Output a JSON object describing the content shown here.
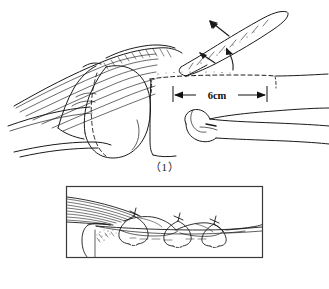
{
  "figure": {
    "background_color": "#ffffff",
    "ink_color": "#1a1a1a",
    "panel_count": 2
  },
  "panels": [
    {
      "id": "panel-1",
      "caption": "（1）",
      "caption_plain": "(1)",
      "description": "Lateral view of shoulder: clavicle / acromion region with muscle striations, humeral head, and elevated bone graft strip indicated by arrows; dashed outline marks the graft donor bed.",
      "framed": false,
      "annotations": {
        "dimension": {
          "label": "6cm",
          "style": "double-headed-arrow",
          "orientation": "horizontal"
        },
        "arrow_count": 2,
        "arrow_targets": [
          "elevated bone graft strip",
          "graft donor bed margin"
        ],
        "dashed_line": "graft donor bed outline"
      }
    },
    {
      "id": "panel-2",
      "caption": "（2）",
      "caption_plain": "(2)",
      "description": "Close-up inset within rectangular frame: graft laid into its bed and secured with three encircling sutures tied over the bone.",
      "framed": true,
      "frame": {
        "stroke_color": "#3a3a3a",
        "stroke_width": 1
      },
      "annotations": {
        "suture_count": 3,
        "suture_label": "encircling suture knot"
      }
    }
  ],
  "colors": {
    "ink": "#1a1a1a",
    "ink_light": "#555555",
    "frame": "#3a3a3a",
    "paper": "#ffffff"
  }
}
